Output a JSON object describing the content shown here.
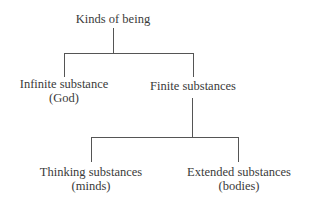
{
  "diagram": {
    "type": "tree",
    "root": {
      "label": "Kinds of being",
      "children": [
        {
          "label": "Infinite substance",
          "sublabel": "(God)"
        },
        {
          "label": "Finite substances",
          "children": [
            {
              "label": "Thinking substances",
              "sublabel": "(minds)"
            },
            {
              "label": "Extended substances",
              "sublabel": "(bodies)"
            }
          ]
        }
      ]
    },
    "line_color": "#555555",
    "text_color": "#3a3a3a"
  },
  "nodes": {
    "root": "Kinds of being",
    "infinite": {
      "line1": "Infinite substance",
      "line2": "(God)"
    },
    "finite": "Finite substances",
    "thinking": {
      "line1": "Thinking substances",
      "line2": "(minds)"
    },
    "extended": {
      "line1": "Extended substances",
      "line2": "(bodies)"
    }
  }
}
